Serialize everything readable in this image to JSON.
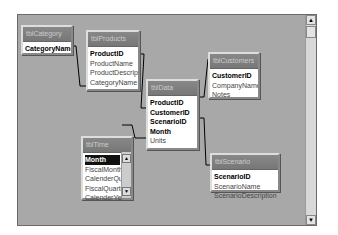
{
  "window": {
    "title": "Relationships"
  },
  "tables": [
    {
      "name": "tblCategory",
      "fields": [
        {
          "label": "CategoryName",
          "pk": true
        }
      ]
    },
    {
      "name": "tblProducts",
      "fields": [
        {
          "label": "ProductID",
          "pk": true
        },
        {
          "label": "ProductName"
        },
        {
          "label": "ProductDescriptic"
        },
        {
          "label": "CategoryName"
        }
      ]
    },
    {
      "name": "tblData",
      "fields": [
        {
          "label": "ProductID",
          "pk": true
        },
        {
          "label": "CustomerID",
          "pk": true
        },
        {
          "label": "ScenarioID",
          "pk": true
        },
        {
          "label": "Month",
          "pk": true
        },
        {
          "label": "Units"
        }
      ]
    },
    {
      "name": "tblCustomers",
      "fields": [
        {
          "label": "CustomerID",
          "pk": true
        },
        {
          "label": "CompanyName"
        },
        {
          "label": "Notes"
        }
      ]
    },
    {
      "name": "tblTime",
      "fields": [
        {
          "label": "Month",
          "pk": true,
          "selected": true
        },
        {
          "label": "FiscalMonth"
        },
        {
          "label": "CalenderQuar"
        },
        {
          "label": "FiscalQuarter"
        },
        {
          "label": "CalenderYear"
        }
      ]
    },
    {
      "name": "tblScenario",
      "fields": [
        {
          "label": "ScenarioID",
          "pk": true
        },
        {
          "label": "ScenarioName"
        },
        {
          "label": "ScenarioDescription"
        }
      ]
    }
  ],
  "scrollbar": {
    "up": "▲",
    "down": "▼"
  }
}
